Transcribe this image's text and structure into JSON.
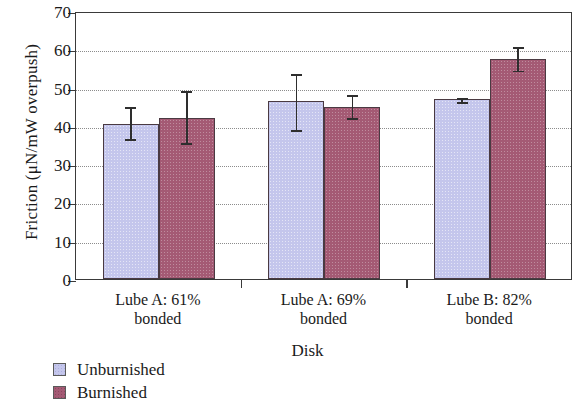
{
  "chart_data": {
    "type": "bar",
    "title": "",
    "xlabel": "Disk",
    "ylabel": "Friction (μN/mW overpush)",
    "ylim": [
      0,
      70
    ],
    "ytick_labels": [
      "70",
      "60",
      "50",
      "40",
      "30",
      "20",
      "10",
      "0"
    ],
    "ytick_values": [
      70,
      60,
      50,
      40,
      30,
      20,
      10,
      0
    ],
    "grid": "horizontal-dotted",
    "legend_position": "below-left",
    "categories": [
      "Lube A: 61% bonded",
      "Lube A: 69% bonded",
      "Lube B: 82% bonded"
    ],
    "category_lines": [
      [
        "Lube A: 61%",
        "bonded"
      ],
      [
        "Lube A: 69%",
        "bonded"
      ],
      [
        "Lube B: 82%",
        "bonded"
      ]
    ],
    "series": [
      {
        "name": "Unburnished",
        "color": "#c4c6ec",
        "values": [
          40.5,
          46.5,
          47.0
        ],
        "error_low": [
          36.5,
          39.0,
          46.3
        ],
        "error_high": [
          45.5,
          54.0,
          47.7
        ]
      },
      {
        "name": "Burnished",
        "color": "#a45a74",
        "values": [
          42.0,
          45.0,
          57.5
        ],
        "error_low": [
          35.5,
          42.0,
          54.5
        ],
        "error_high": [
          49.5,
          48.5,
          61.0
        ]
      }
    ]
  },
  "legend": {
    "items": [
      {
        "label": "Unburnished",
        "color": "#c4c6ec"
      },
      {
        "label": "Burnished",
        "color": "#a45a74"
      }
    ]
  }
}
